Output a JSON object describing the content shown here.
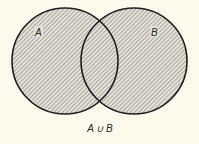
{
  "diagram": {
    "type": "venn",
    "sets": [
      {
        "label": "A",
        "cx": 65,
        "cy": 61,
        "r": 53
      },
      {
        "label": "B",
        "cx": 134,
        "cy": 61,
        "r": 53
      }
    ],
    "caption": "A ∪ B",
    "shaded_region": "union",
    "colors": {
      "background": "#fbf8ec",
      "stroke": "#1e1e1e",
      "hatch_light": "#e4e2d8",
      "hatch_dark": "#8e8c86"
    }
  }
}
